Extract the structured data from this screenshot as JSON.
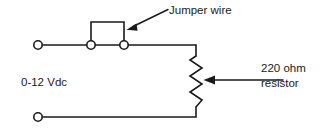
{
  "diagram": {
    "labels": {
      "jumper_wire": "Jumper wire",
      "source": "0-12 Vdc",
      "resistor_line1": "220 ohm",
      "resistor_line2": "resistor"
    },
    "colors": {
      "line": "#1a1a1a",
      "text": "#1a1a1a",
      "background": "#ffffff",
      "terminal_fill": "#ffffff"
    },
    "components": [
      {
        "name": "terminal-top-left",
        "type": "terminal-post",
        "cx": 38,
        "cy": 45,
        "r": 4.5
      },
      {
        "name": "terminal-jumper-left",
        "type": "terminal-post",
        "cx": 91,
        "cy": 45,
        "r": 4.5
      },
      {
        "name": "terminal-jumper-right",
        "type": "terminal-post",
        "cx": 124,
        "cy": 45,
        "r": 4.5
      },
      {
        "name": "terminal-bottom-left",
        "type": "terminal-post",
        "cx": 38,
        "cy": 117,
        "r": 4.5
      },
      {
        "name": "jumper-wire",
        "type": "wire-bridge",
        "path": "M91,45 L91,22 L124,22 L124,45"
      },
      {
        "name": "resistor",
        "type": "zigzag-resistor",
        "zigzag_center_x": 196,
        "zigzag_top_y": 55,
        "zigzag_bottom_y": 108,
        "amplitude": 6,
        "peaks": 6
      },
      {
        "name": "top-conductor",
        "type": "wire",
        "path": "M38,45 L196,45"
      },
      {
        "name": "bottom-conductor",
        "type": "wire",
        "path": "M38,117 L196,117"
      }
    ],
    "annotations": [
      {
        "name": "jumper-wire-arrow",
        "type": "leader-arrow",
        "from_x": 168,
        "from_y": 9,
        "to_x": 127,
        "to_y": 29
      },
      {
        "name": "resistor-arrow",
        "type": "leader-arrow",
        "from_x": 283,
        "from_y": 80,
        "to_x": 204,
        "to_y": 80
      }
    ]
  }
}
